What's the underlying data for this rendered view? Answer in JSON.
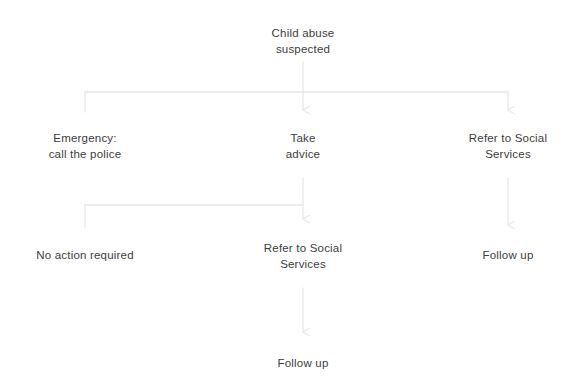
{
  "diagram": {
    "title_text": "Child abuse suspected",
    "background_color": "#ffffff",
    "text_color": "#3c3c3c",
    "line_color": "#e8e8e8",
    "nodes": [
      {
        "id": "root",
        "label": "Child abuse\nsuspected",
        "x": 303,
        "y": 25
      },
      {
        "id": "emergency",
        "label": "Emergency:\ncall the police",
        "x": 85,
        "y": 130
      },
      {
        "id": "take-advice",
        "label": "Take\nadvice",
        "x": 303,
        "y": 130
      },
      {
        "id": "refer-social-1",
        "label": "Refer to Social\nServices",
        "x": 508,
        "y": 130
      },
      {
        "id": "no-action",
        "label": "No action required",
        "x": 85,
        "y": 247
      },
      {
        "id": "refer-social-2",
        "label": "Refer to Social\nServices",
        "x": 303,
        "y": 240
      },
      {
        "id": "follow-up-right",
        "label": "Follow up",
        "x": 508,
        "y": 247
      },
      {
        "id": "follow-up-bottom",
        "label": "Follow up",
        "x": 303,
        "y": 355
      }
    ],
    "edges": [
      {
        "id": "root-to-bus",
        "from": "root",
        "to": "level1-bus",
        "arrow": false
      },
      {
        "id": "bus-to-emergency",
        "from": "level1-bus",
        "to": "emergency",
        "arrow": false
      },
      {
        "id": "bus-to-take-advice",
        "from": "level1-bus",
        "to": "take-advice",
        "arrow": true
      },
      {
        "id": "bus-to-refer-social-1",
        "from": "level1-bus",
        "to": "refer-social-1",
        "arrow": true
      },
      {
        "id": "take-advice-to-bus2",
        "from": "take-advice",
        "to": "level2-bus",
        "arrow": false
      },
      {
        "id": "bus2-to-no-action",
        "from": "level2-bus",
        "to": "no-action",
        "arrow": false
      },
      {
        "id": "bus2-to-refer-social-2",
        "from": "level2-bus",
        "to": "refer-social-2",
        "arrow": true
      },
      {
        "id": "refer1-to-follow-up",
        "from": "refer-social-1",
        "to": "follow-up-right",
        "arrow": true
      },
      {
        "id": "refer2-to-follow-up",
        "from": "refer-social-2",
        "to": "follow-up-bottom",
        "arrow": true
      }
    ]
  }
}
